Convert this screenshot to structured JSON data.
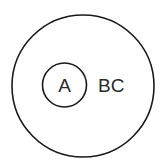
{
  "diagram": {
    "type": "nested-sets",
    "outer_set": {
      "label": "BC",
      "color": "#1a1a1a"
    },
    "inner_set": {
      "label": "A",
      "color": "#1a1a1a"
    },
    "background": "#ffffff"
  }
}
